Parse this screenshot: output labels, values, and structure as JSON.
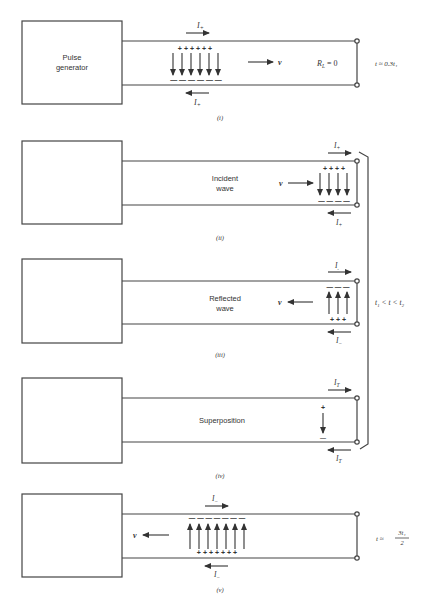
{
  "figure": {
    "panels": [
      {
        "id": "i",
        "caption": "(i)",
        "box_label_line1": "Pulse",
        "box_label_line2": "generator",
        "top_current": "I+",
        "bottom_current": "I+",
        "velocity": "v",
        "load": "R_L = 0",
        "load_display": "RL = 0",
        "time": "t ≈ 0.3t₁",
        "charges_top": "+ + + + + +",
        "charges_bottom": "— — — — — —",
        "field_arrows": 6,
        "field_direction": "down"
      },
      {
        "id": "ii",
        "caption": "(ii)",
        "wave_label_line1": "Incident",
        "wave_label_line2": "wave",
        "top_current": "I+",
        "bottom_current": "I+",
        "velocity": "v",
        "field_arrows": 4,
        "field_direction": "down",
        "charges_top": "+ + + +",
        "charges_bottom": "— — — —"
      },
      {
        "id": "iii",
        "caption": "(iii)",
        "wave_label_line1": "Reflected",
        "wave_label_line2": "wave",
        "top_current": "I−",
        "bottom_current": "I−",
        "velocity": "v",
        "field_arrows": 3,
        "field_direction": "up",
        "charges_top": "— — —",
        "charges_bottom": "+ + +"
      },
      {
        "id": "iv",
        "caption": "(iv)",
        "wave_label": "Superposition",
        "top_current": "IT",
        "bottom_current": "IT",
        "charge_top": "+",
        "charge_bottom": "—"
      },
      {
        "id": "v",
        "caption": "(v)",
        "top_current": "I−",
        "bottom_current": "I−",
        "velocity": "v",
        "time_prefix": "t ≈",
        "time_numerator": "3t₁",
        "time_denominator": "2",
        "field_arrows": 7,
        "field_direction": "up",
        "charges_top": "— — — — — — —",
        "charges_bottom": "+ + + + + + +"
      }
    ],
    "bracket_label": "t₁ < t < t₂"
  }
}
